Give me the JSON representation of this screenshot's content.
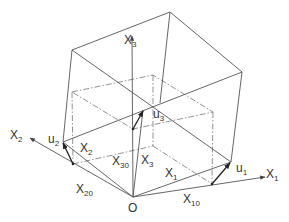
{
  "figure": {
    "labels": {
      "x1_axis": {
        "base": "X",
        "sub": "1"
      },
      "x2_axis": {
        "base": "X",
        "sub": "2"
      },
      "x3_axis": {
        "base": "X",
        "sub": "3"
      },
      "x1_vec": {
        "base": "X",
        "sub": "1"
      },
      "x2_vec": {
        "base": "X",
        "sub": "2"
      },
      "x3_vec": {
        "base": "X",
        "sub": "3"
      },
      "x10": {
        "base": "X",
        "sub": "10"
      },
      "x20": {
        "base": "X",
        "sub": "20"
      },
      "x30": {
        "base": "X",
        "sub": "30"
      },
      "u1": {
        "base": "u",
        "sub": "1"
      },
      "u2": {
        "base": "u",
        "sub": "2"
      },
      "u3": {
        "base": "u",
        "sub": "3"
      },
      "origin": "O"
    },
    "colors": {
      "line": "#555555",
      "dash_line": "#777777",
      "vector": "#222222",
      "text": "#333333"
    }
  }
}
